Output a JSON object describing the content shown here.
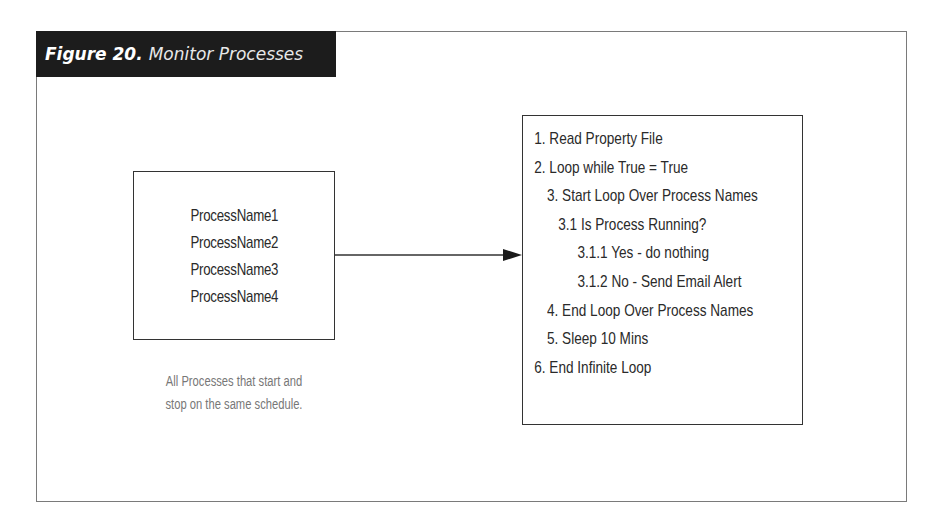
{
  "figure": {
    "label": "Figure 20.",
    "title": "Monitor Processes",
    "colors": {
      "title_bar_bg": "#1c1c1c",
      "title_text": "#ffffff",
      "border": "#333333",
      "caption_text": "#777777"
    }
  },
  "left_box": {
    "processes": [
      "ProcessName1",
      "ProcessName2",
      "ProcessName3",
      "ProcessName4"
    ],
    "caption_lines": [
      "All Processes that start and",
      "stop on the same schedule."
    ]
  },
  "connector": {
    "type": "arrow",
    "direction": "left-to-right"
  },
  "right_box": {
    "steps": [
      {
        "text": "1. Read Property File",
        "level": 0
      },
      {
        "text": "2. Loop while True = True",
        "level": 0
      },
      {
        "text": "3. Start Loop Over Process Names",
        "level": 1
      },
      {
        "text": "3.1  Is Process Running?",
        "level": 2
      },
      {
        "text": "3.1.1   Yes - do nothing",
        "level": 3
      },
      {
        "text": "3.1.2  No - Send Email Alert",
        "level": 3
      },
      {
        "text": "4. End Loop Over Process Names",
        "level": 1
      },
      {
        "text": "5. Sleep 10 Mins",
        "level": 1
      },
      {
        "text": "6. End Infinite Loop",
        "level": 0
      }
    ]
  }
}
